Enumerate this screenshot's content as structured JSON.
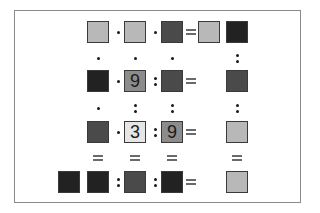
{
  "puzzle": {
    "title": "",
    "colors": {
      "light": "#b8b8b8",
      "very_light": "#e6e6e6",
      "medium": "#8c8c8c",
      "dark": "#4a4a4a",
      "near_black": "#222222",
      "frame": "#8a8a8a"
    },
    "tiles": [
      {
        "id": "r0c0",
        "x": 87,
        "y": 21,
        "shade": "light",
        "value": ""
      },
      {
        "id": "r0c1",
        "x": 124,
        "y": 21,
        "shade": "light",
        "value": ""
      },
      {
        "id": "r0c2",
        "x": 161,
        "y": 21,
        "shade": "dark",
        "value": ""
      },
      {
        "id": "r0c3",
        "x": 198,
        "y": 21,
        "shade": "light",
        "value": ""
      },
      {
        "id": "r0c4",
        "x": 226,
        "y": 21,
        "shade": "near_black",
        "value": ""
      },
      {
        "id": "r1c0",
        "x": 87,
        "y": 70,
        "shade": "near_black",
        "value": ""
      },
      {
        "id": "r1c1",
        "x": 124,
        "y": 70,
        "shade": "medium",
        "value": "9"
      },
      {
        "id": "r1c2",
        "x": 161,
        "y": 70,
        "shade": "dark",
        "value": ""
      },
      {
        "id": "r1c4",
        "x": 226,
        "y": 70,
        "shade": "dark",
        "value": ""
      },
      {
        "id": "r2c0",
        "x": 87,
        "y": 121,
        "shade": "dark",
        "value": ""
      },
      {
        "id": "r2c1",
        "x": 124,
        "y": 121,
        "shade": "very_light",
        "value": "3"
      },
      {
        "id": "r2c2",
        "x": 161,
        "y": 121,
        "shade": "medium",
        "value": "9"
      },
      {
        "id": "r2c4",
        "x": 226,
        "y": 121,
        "shade": "light",
        "value": ""
      },
      {
        "id": "r3cx",
        "x": 58,
        "y": 171,
        "shade": "near_black",
        "value": ""
      },
      {
        "id": "r3c0",
        "x": 87,
        "y": 171,
        "shade": "near_black",
        "value": ""
      },
      {
        "id": "r3c1",
        "x": 124,
        "y": 171,
        "shade": "dark",
        "value": ""
      },
      {
        "id": "r3c2",
        "x": 161,
        "y": 171,
        "shade": "near_black",
        "value": ""
      },
      {
        "id": "r3c4",
        "x": 226,
        "y": 171,
        "shade": "light",
        "value": ""
      }
    ],
    "row_ops": [
      [
        "×",
        "×",
        "="
      ],
      [
        "×",
        "÷",
        "="
      ],
      [
        "×",
        "÷",
        "="
      ],
      [
        "÷",
        "÷",
        "="
      ]
    ],
    "col_ops": [
      [
        "×",
        "×",
        "×",
        "÷"
      ],
      [
        "×",
        "÷",
        "÷",
        "÷"
      ],
      [
        "=",
        "=",
        "=",
        "="
      ]
    ]
  }
}
